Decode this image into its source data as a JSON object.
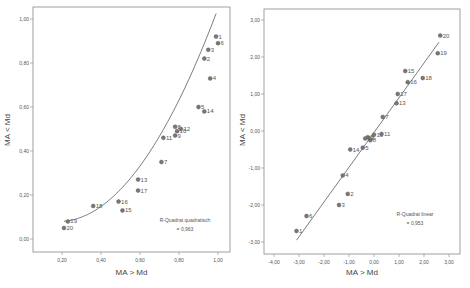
{
  "chart_data": [
    {
      "type": "scatter",
      "title": "",
      "xlabel": "MA > Md",
      "ylabel": "MA < Md",
      "xlim": [
        0.1,
        1.03
      ],
      "ylim": [
        -0.06,
        1.05
      ],
      "xticks": [
        "0,20",
        "0,40",
        "0,60",
        "0,80",
        "1,00"
      ],
      "yticks": [
        "0,00",
        "0,20",
        "0,40",
        "0,60",
        "0,80",
        "1,00"
      ],
      "grid": false,
      "fit": {
        "type": "quadratic",
        "label": "R-Quadrat quadratisch",
        "r2": "= 0,963"
      },
      "points": [
        {
          "id": "1",
          "x": 0.99,
          "y": 0.92
        },
        {
          "id": "2",
          "x": 0.93,
          "y": 0.82
        },
        {
          "id": "3",
          "x": 0.95,
          "y": 0.86
        },
        {
          "id": "4",
          "x": 0.96,
          "y": 0.73
        },
        {
          "id": "5",
          "x": 0.9,
          "y": 0.6
        },
        {
          "id": "6",
          "x": 1.0,
          "y": 0.89
        },
        {
          "id": "7",
          "x": 0.71,
          "y": 0.35
        },
        {
          "id": "8",
          "x": 0.78,
          "y": 0.51
        },
        {
          "id": "9",
          "x": 0.78,
          "y": 0.47
        },
        {
          "id": "10",
          "x": 0.79,
          "y": 0.49
        },
        {
          "id": "11",
          "x": 0.72,
          "y": 0.46
        },
        {
          "id": "12",
          "x": 0.81,
          "y": 0.5
        },
        {
          "id": "13",
          "x": 0.59,
          "y": 0.27
        },
        {
          "id": "14",
          "x": 0.93,
          "y": 0.58
        },
        {
          "id": "15",
          "x": 0.51,
          "y": 0.13
        },
        {
          "id": "16",
          "x": 0.49,
          "y": 0.17
        },
        {
          "id": "17",
          "x": 0.59,
          "y": 0.22
        },
        {
          "id": "18",
          "x": 0.36,
          "y": 0.15
        },
        {
          "id": "19",
          "x": 0.23,
          "y": 0.08
        },
        {
          "id": "20",
          "x": 0.21,
          "y": 0.05
        }
      ]
    },
    {
      "type": "scatter",
      "title": "",
      "xlabel": "MA > Md",
      "ylabel": "MA < Md",
      "xlim": [
        -4.4,
        3.4
      ],
      "ylim": [
        -3.35,
        3.3
      ],
      "xticks": [
        "-4,00",
        "-3,00",
        "-2,00",
        "-1,00",
        "0,00",
        "1,00",
        "2,00",
        "3,00"
      ],
      "yticks": [
        "-3,00",
        "-2,00",
        "-1,00",
        "0,00",
        "1,00",
        "2,00",
        "3,00"
      ],
      "grid": false,
      "fit": {
        "type": "linear",
        "label": "R-Quadrat linear",
        "r2": "= 0,953"
      },
      "points": [
        {
          "id": "1",
          "x": -3.1,
          "y": -2.7
        },
        {
          "id": "2",
          "x": -1.05,
          "y": -1.7
        },
        {
          "id": "3",
          "x": -1.4,
          "y": -2.0
        },
        {
          "id": "4",
          "x": -1.25,
          "y": -1.2
        },
        {
          "id": "5",
          "x": -0.45,
          "y": -0.45
        },
        {
          "id": "6",
          "x": -2.7,
          "y": -2.3
        },
        {
          "id": "7",
          "x": 0.35,
          "y": 0.38
        },
        {
          "id": "8",
          "x": -0.15,
          "y": -0.25
        },
        {
          "id": "9",
          "x": -0.25,
          "y": -0.17
        },
        {
          "id": "10",
          "x": 0.0,
          "y": -0.1
        },
        {
          "id": "11",
          "x": 0.3,
          "y": -0.08
        },
        {
          "id": "12",
          "x": -0.35,
          "y": -0.2
        },
        {
          "id": "13",
          "x": 0.9,
          "y": 0.75
        },
        {
          "id": "14",
          "x": -0.95,
          "y": -0.5
        },
        {
          "id": "15",
          "x": 1.25,
          "y": 1.62
        },
        {
          "id": "16",
          "x": 1.35,
          "y": 1.32
        },
        {
          "id": "17",
          "x": 0.95,
          "y": 1.0
        },
        {
          "id": "18",
          "x": 1.95,
          "y": 1.43
        },
        {
          "id": "19",
          "x": 2.55,
          "y": 2.1
        },
        {
          "id": "20",
          "x": 2.65,
          "y": 2.58
        }
      ]
    }
  ]
}
